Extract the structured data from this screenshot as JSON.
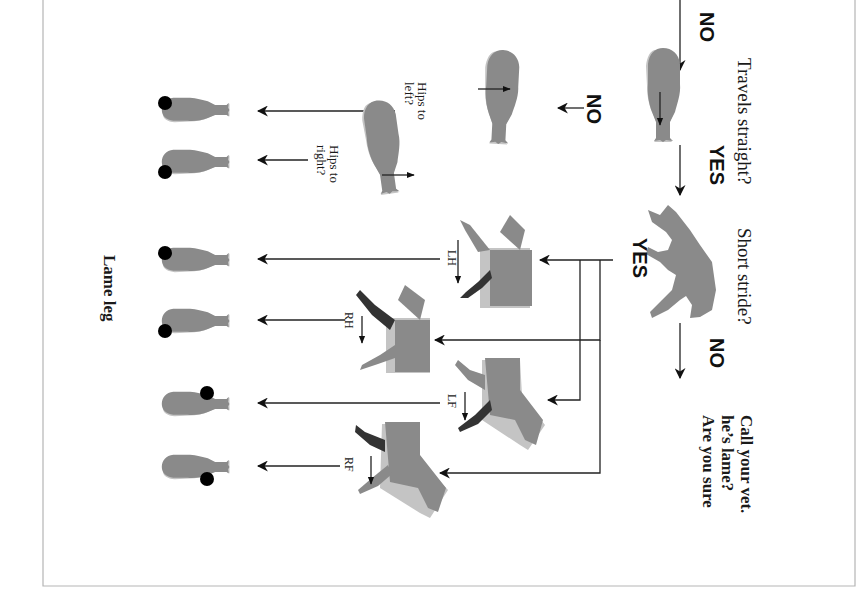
{
  "diagram": {
    "orientation": "rotated 90deg clockwise",
    "colors": {
      "horse": "#8a8a8a",
      "shadow": "#c4c4c4",
      "lame_highlight": "#333333",
      "dot": "#000000",
      "frame": "#b5b5b5"
    },
    "questions": {
      "travels_straight": "Travels straight?",
      "short_stride": "Short stride?",
      "hips_left": [
        "Hips to",
        "left?"
      ],
      "hips_right": [
        "Hips to",
        "right?"
      ]
    },
    "answers": {
      "top_no": "NO",
      "straight_no": "NO",
      "straight_yes": "YES",
      "stride_yes": "YES",
      "stride_no": "NO"
    },
    "conclusion": [
      "Are you sure",
      "he’s lame?",
      "Call your vet."
    ],
    "legs": {
      "lh": "LH",
      "rh": "RH",
      "lf": "LF",
      "rf": "RF"
    },
    "result_label": "Lame leg"
  }
}
